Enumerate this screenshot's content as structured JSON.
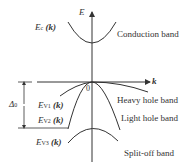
{
  "diagram": {
    "type": "band-structure",
    "axes": {
      "y_label": "E",
      "x_label": "k",
      "origin_label": "0"
    },
    "bands": [
      {
        "id": "conduction",
        "symbol": "E",
        "subscript": "c",
        "arg": "(k)",
        "name": "Conduction band"
      },
      {
        "id": "heavy-hole",
        "symbol": "E",
        "subscript": "V1",
        "arg": "(k)",
        "name": "Heavy hole band"
      },
      {
        "id": "light-hole",
        "symbol": "E",
        "subscript": "V2",
        "arg": "(k)",
        "name": "Light hole band"
      },
      {
        "id": "split-off",
        "symbol": "E",
        "subscript": "V3",
        "arg": "(k)",
        "name": "Split-off band"
      }
    ],
    "split_off_energy": {
      "symbol": "Δ",
      "subscript": "0"
    },
    "line_color": "#333333"
  }
}
